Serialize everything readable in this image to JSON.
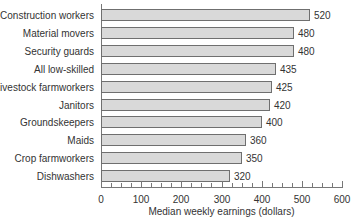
{
  "chart_data": {
    "type": "bar",
    "orientation": "horizontal",
    "title": "",
    "xlabel": "Median weekly earnings (dollars)",
    "ylabel": "",
    "xlim": [
      0,
      600
    ],
    "x_ticks": [
      0,
      100,
      200,
      300,
      400,
      500,
      600
    ],
    "minor_tick_step": 25,
    "grid": false,
    "legend": null,
    "categories": [
      "Construction workers",
      "Material movers",
      "Security guards",
      "All low-skilled",
      "Livestock farmworkers",
      "Janitors",
      "Groundskeepers",
      "Maids",
      "Crop farmworkers",
      "Dishwashers"
    ],
    "values": [
      520,
      480,
      480,
      435,
      425,
      420,
      400,
      360,
      350,
      320
    ],
    "bar_color": "#d9d9d9",
    "bar_edge_color": "#6f6f6f"
  },
  "labels": {
    "xlabel": "Median weekly earnings (dollars)",
    "ticks": [
      "0",
      "100",
      "200",
      "300",
      "400",
      "500",
      "600"
    ]
  }
}
